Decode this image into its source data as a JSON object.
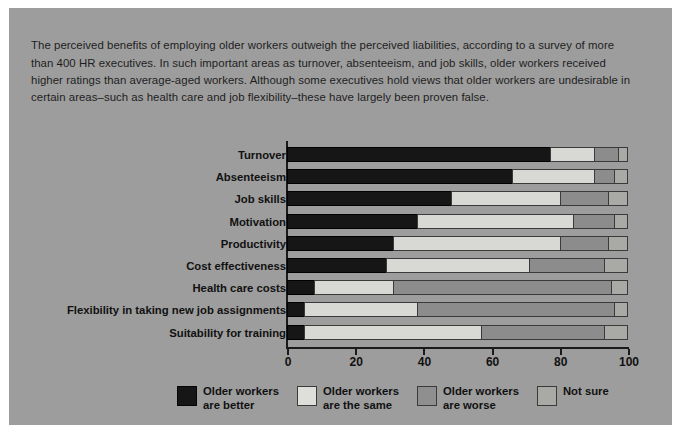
{
  "figure": {
    "background_color": "#9d9d9d",
    "intro_text": "The perceived benefits of employing older workers outweigh the perceived liabilities, according to a survey of more than 400 HR executives. In such important areas as turnover, absenteeism, and job skills, older workers received higher ratings than average-aged workers. Although some executives hold views that older workers are undesirable in certain areas–such as health care and job flexibility–these have largely been proven false."
  },
  "chart_data": {
    "type": "bar",
    "orientation": "horizontal",
    "stacked": true,
    "stack_mode": "percent",
    "title": "",
    "xlabel": "",
    "ylabel": "",
    "xlim": [
      0,
      100
    ],
    "xticks": [
      0,
      20,
      40,
      60,
      80,
      100
    ],
    "xticklabels": [
      "0",
      "20",
      "40",
      "60",
      "80",
      "100"
    ],
    "grid": false,
    "legend_position": "bottom",
    "categories": [
      "Turnover",
      "Absenteeism",
      "Job skills",
      "Motivation",
      "Productivity",
      "Cost effectiveness",
      "Health care costs",
      "Flexibility in taking new job assignments",
      "Suitability for training"
    ],
    "series": [
      {
        "name": "Older workers are better",
        "color": "#161616",
        "values": [
          77,
          66,
          48,
          38,
          31,
          29,
          8,
          5,
          5
        ]
      },
      {
        "name": "Older workers are the same",
        "color": "#d8d8d4",
        "values": [
          13,
          24,
          32,
          46,
          49,
          42,
          23,
          33,
          52
        ]
      },
      {
        "name": "Older workers are worse",
        "color": "#8c8c8c",
        "values": [
          7,
          6,
          14,
          12,
          14,
          22,
          64,
          58,
          36
        ]
      },
      {
        "name": "Not sure",
        "color": "#a9a9a6",
        "values": [
          3,
          4,
          6,
          4,
          6,
          7,
          5,
          4,
          7
        ]
      }
    ]
  },
  "legend": {
    "items": [
      {
        "label": "Older workers\nare better",
        "color": "#161616",
        "swatch": "swatch-older-better"
      },
      {
        "label": "Older workers\nare the same",
        "color": "#d8d8d4",
        "swatch": "swatch-older-same"
      },
      {
        "label": "Older workers\nare worse",
        "color": "#8c8c8c",
        "swatch": "swatch-older-worse"
      },
      {
        "label": "Not sure",
        "color": "#a9a9a6",
        "swatch": "swatch-not-sure"
      }
    ]
  }
}
